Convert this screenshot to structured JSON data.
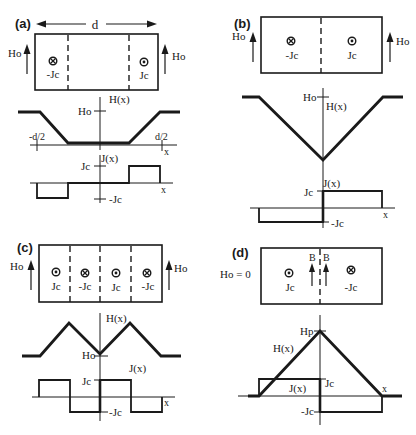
{
  "figure": {
    "panels": [
      {
        "id": "a",
        "label": "(a)",
        "width_label": "d",
        "applied_field_label": "Ho",
        "current_labels": [
          "-Jc",
          "Jc"
        ],
        "current_symbols": [
          "into-page",
          "out-of-page"
        ],
        "field_plot": {
          "y_label": "H(x)",
          "y_tick": "Ho",
          "x_label": "x",
          "x_ticks": [
            "-d/2",
            "d/2"
          ]
        },
        "current_plot": {
          "y_label": "J(x)",
          "y_ticks": [
            "Jc",
            "-Jc"
          ],
          "x_label": "x"
        }
      },
      {
        "id": "b",
        "label": "(b)",
        "applied_field_label": "Ho",
        "current_labels": [
          "-Jc",
          "Jc"
        ],
        "current_symbols": [
          "into-page",
          "out-of-page"
        ],
        "field_plot": {
          "y_label": "H(x)",
          "y_tick": "Ho"
        },
        "current_plot": {
          "y_label": "J(x)",
          "y_ticks": [
            "Jc",
            "-Jc"
          ],
          "x_label": "x"
        }
      },
      {
        "id": "c",
        "label": "(c)",
        "applied_field_label": "Ho",
        "current_labels": [
          "Jc",
          "-Jc",
          "Jc",
          "-Jc"
        ],
        "current_symbols": [
          "out-of-page",
          "into-page",
          "out-of-page",
          "into-page"
        ],
        "field_plot": {
          "y_label": "H(x)",
          "y_tick": "Ho"
        },
        "current_plot": {
          "y_label": "J(x)",
          "y_ticks": [
            "Jc",
            "-Jc"
          ],
          "x_label": "x"
        }
      },
      {
        "id": "d",
        "label": "(d)",
        "applied_field_label": "Ho = 0",
        "induction_labels": [
          "B",
          "B"
        ],
        "current_labels": [
          "Jc",
          "-Jc"
        ],
        "current_symbols": [
          "out-of-page",
          "into-page"
        ],
        "field_plot": {
          "y_label": "H(x)",
          "y_tick": "Hp",
          "x_label": "x"
        },
        "current_plot": {
          "y_label": "J(x)",
          "y_ticks": [
            "Jc",
            "-Jc"
          ]
        }
      }
    ]
  }
}
